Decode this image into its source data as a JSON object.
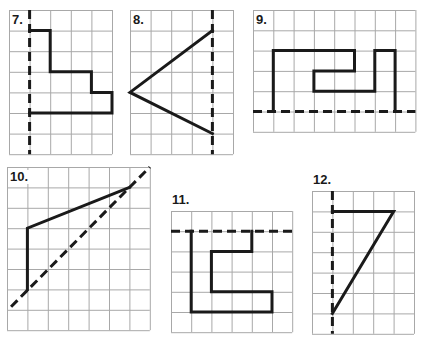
{
  "colors": {
    "grid": "#a8a8a8",
    "ink": "#1a1a1a",
    "background": "#ffffff"
  },
  "exercises": [
    {
      "label": "7.",
      "origin": [
        9,
        10
      ],
      "cell": 20.6,
      "cols": 5,
      "rows": 7,
      "axis": {
        "type": "vertical",
        "points": [
          [
            1,
            0
          ],
          [
            1,
            7
          ]
        ]
      },
      "shape": [
        [
          1,
          1
        ],
        [
          2,
          1
        ],
        [
          2,
          3
        ],
        [
          4,
          3
        ],
        [
          4,
          4
        ],
        [
          5,
          4
        ],
        [
          5,
          5
        ],
        [
          1,
          5
        ]
      ],
      "closed": false
    },
    {
      "label": "8.",
      "origin": [
        130,
        10
      ],
      "cell": 20.6,
      "cols": 5,
      "rows": 7,
      "axis": {
        "type": "vertical",
        "points": [
          [
            4,
            0
          ],
          [
            4,
            7
          ]
        ]
      },
      "shape": [
        [
          4,
          1
        ],
        [
          0,
          4
        ],
        [
          4,
          6
        ]
      ],
      "closed": false
    },
    {
      "label": "9.",
      "origin": [
        253,
        10
      ],
      "cell": 20.3,
      "cols": 8,
      "rows": 6,
      "axis": {
        "type": "horizontal",
        "points": [
          [
            0,
            5
          ],
          [
            8,
            5
          ]
        ]
      },
      "shape": [
        [
          1,
          5
        ],
        [
          1,
          2
        ],
        [
          5,
          2
        ],
        [
          5,
          3
        ],
        [
          3,
          3
        ],
        [
          3,
          4
        ],
        [
          6,
          4
        ],
        [
          6,
          2
        ],
        [
          7,
          2
        ],
        [
          7,
          5
        ]
      ],
      "closed": false
    },
    {
      "label": "10.",
      "origin": [
        7,
        167
      ],
      "cell": 20.4,
      "cols": 7,
      "rows": 8,
      "axis": {
        "type": "diagonal",
        "points": [
          [
            0.2,
            6.85
          ],
          [
            7,
            0
          ]
        ]
      },
      "shape": [
        [
          1,
          6
        ],
        [
          1,
          3
        ],
        [
          6,
          1
        ]
      ],
      "closed": false
    },
    {
      "label": "11.",
      "origin": [
        171,
        211
      ],
      "cell": 20.2,
      "cols": 6,
      "rows": 6,
      "axis": {
        "type": "horizontal",
        "points": [
          [
            0,
            1
          ],
          [
            6,
            1
          ]
        ]
      },
      "shape": [
        [
          1,
          1
        ],
        [
          1,
          5
        ],
        [
          5,
          5
        ],
        [
          5,
          4
        ],
        [
          2,
          4
        ],
        [
          2,
          2
        ],
        [
          4,
          2
        ],
        [
          4,
          1
        ]
      ],
      "closed": false
    },
    {
      "label": "12.",
      "origin": [
        312,
        191
      ],
      "cell": 20.4,
      "cols": 5,
      "rows": 7,
      "axis": {
        "type": "vertical",
        "points": [
          [
            1,
            0
          ],
          [
            1,
            7
          ]
        ]
      },
      "shape": [
        [
          1,
          1
        ],
        [
          4,
          1
        ],
        [
          1,
          6
        ]
      ],
      "closed": false
    }
  ]
}
